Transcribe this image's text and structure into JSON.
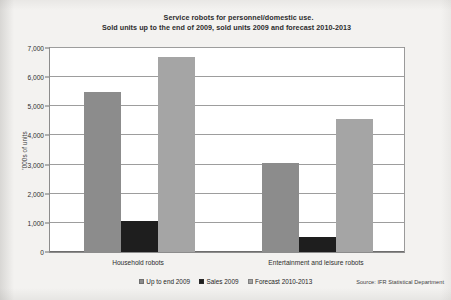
{
  "chart_data": {
    "type": "bar",
    "title": "Service robots for personnel/domestic use.",
    "subtitle": "Sold units up to the end of 2009, sold units 2009 and forecast 2010-2013",
    "xlabel": "",
    "ylabel": "'000s of units",
    "ylim": [
      0,
      7000
    ],
    "ytick_labels": [
      "7,000",
      "6,000",
      "5,000",
      "4,000",
      "3,000",
      "2,000",
      "1,000",
      "0"
    ],
    "ytick_values": [
      7000,
      6000,
      5000,
      4000,
      3000,
      2000,
      1000,
      0
    ],
    "grid": true,
    "legend_position": "bottom",
    "categories": [
      "Household robots",
      "Entertainment and leisure robots"
    ],
    "series": [
      {
        "name": "Up to end 2009",
        "color": "#8c8c8c",
        "values": [
          5500,
          3050
        ]
      },
      {
        "name": "Sales 2009",
        "color": "#1e1e1e",
        "values": [
          1050,
          500
        ]
      },
      {
        "name": "Forecast 2010-2013",
        "color": "#a5a5a5",
        "values": [
          6700,
          4550
        ]
      }
    ],
    "source": "Source: IFR Statistical Department"
  }
}
